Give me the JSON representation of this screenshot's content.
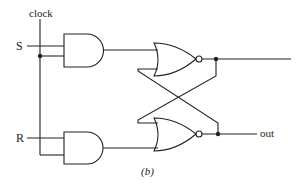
{
  "diagram": {
    "caption": "(b)",
    "labels": {
      "clock": "clock",
      "s": "S",
      "r": "R",
      "out": "out"
    },
    "components": [
      {
        "id": "and-top",
        "type": "AND",
        "inputs": [
          "S",
          "clock"
        ]
      },
      {
        "id": "and-bottom",
        "type": "AND",
        "inputs": [
          "R",
          "clock"
        ]
      },
      {
        "id": "nor-top",
        "type": "NOR",
        "inputs": [
          "and-top",
          "nor-bottom"
        ]
      },
      {
        "id": "nor-bottom",
        "type": "NOR",
        "inputs": [
          "nor-top",
          "and-bottom"
        ],
        "output_label": "out"
      }
    ],
    "colors": {
      "stroke": "#222222",
      "background": "#ffffff"
    }
  }
}
